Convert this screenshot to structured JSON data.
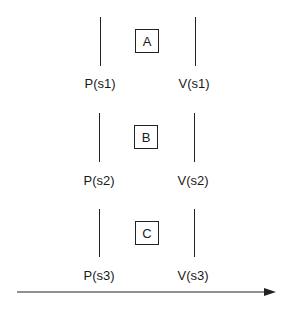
{
  "rows": [
    {
      "task": "A",
      "p_label": "P(s1)",
      "v_label": "V(s1)"
    },
    {
      "task": "B",
      "p_label": "P(s2)",
      "v_label": "V(s2)"
    },
    {
      "task": "C",
      "p_label": "P(s3)",
      "v_label": "V(s3)"
    }
  ],
  "arrow": {
    "meaning": "time-axis"
  }
}
